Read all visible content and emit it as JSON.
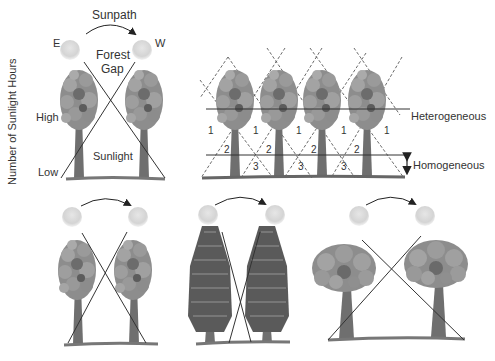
{
  "panel_a": {
    "y_axis_label": "Number of Sunlight Hours",
    "sunpath_label": "Sunpath",
    "east_label": "E",
    "west_label": "W",
    "gap_label_line1": "Forest",
    "gap_label_line2": "Gap",
    "high_label": "High",
    "low_label": "Low",
    "sunlight_label": "Sunlight"
  },
  "panel_b": {
    "zone_labels": [
      "1",
      "1",
      "1",
      "1",
      "1",
      "2",
      "2",
      "2",
      "2",
      "3",
      "3",
      "3"
    ],
    "heterogeneous_label": "Heterogeneous",
    "homogeneous_label": "Homogeneous"
  },
  "bottom_panels": [
    {
      "tree_type": "broadleaf-narrow-gap"
    },
    {
      "tree_type": "conifer-narrow-gap"
    },
    {
      "tree_type": "broadleaf-wide-crown"
    }
  ],
  "colors": {
    "foliage": "#8a8a8a",
    "foliage_dark": "#5e5e5e",
    "trunk": "#6f6f6f",
    "sun": "#d8d8d8",
    "line": "#333333",
    "text": "#333333"
  }
}
